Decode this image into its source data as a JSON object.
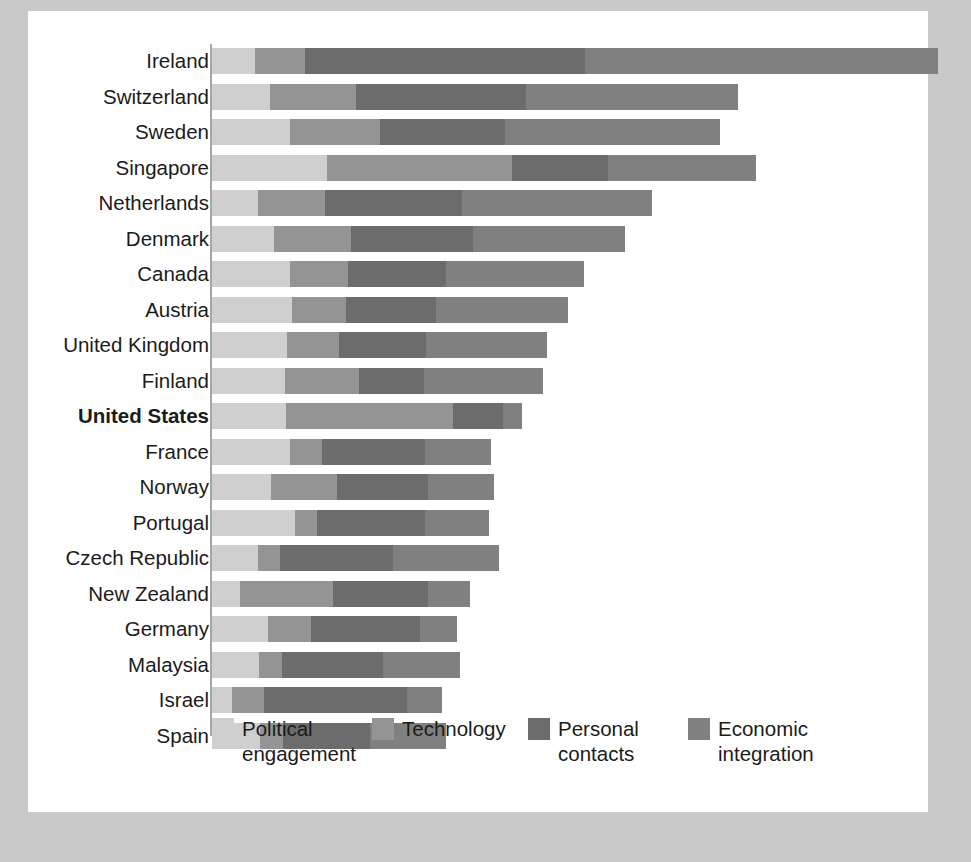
{
  "chart_data": {
    "type": "bar",
    "subtype": "horizontal-stacked",
    "title": "",
    "xlabel": "",
    "ylabel": "",
    "grid": false,
    "legend_position": "bottom",
    "axis_origin_px": 212,
    "px_per_unit": 7.26,
    "xlim": [
      0,
      100
    ],
    "categories": [
      "Ireland",
      "Switzerland",
      "Sweden",
      "Singapore",
      "Netherlands",
      "Denmark",
      "Canada",
      "Austria",
      "United Kingdom",
      "Finland",
      "United States",
      "France",
      "Norway",
      "Portugal",
      "Czech Republic",
      "New Zealand",
      "Germany",
      "Malaysia",
      "Israel",
      "Spain"
    ],
    "highlighted_category": "United States",
    "series": [
      {
        "name": "Political engagement",
        "color": "#cfcfcf",
        "values": [
          5.9,
          8.0,
          10.7,
          15.8,
          6.3,
          8.5,
          10.7,
          11.0,
          10.3,
          10.0,
          10.2,
          10.7,
          8.1,
          11.4,
          6.3,
          3.9,
          7.7,
          6.5,
          2.8,
          6.6
        ]
      },
      {
        "name": "Technology",
        "color": "#949494",
        "values": [
          6.9,
          11.8,
          12.4,
          25.5,
          9.2,
          10.6,
          8.1,
          7.4,
          7.2,
          10.3,
          23.0,
          4.4,
          9.1,
          3.0,
          3.0,
          12.8,
          6.0,
          3.2,
          4.3,
          3.2
        ]
      },
      {
        "name": "Personal contacts",
        "color": "#6c6c6c",
        "values": [
          38.6,
          23.4,
          17.2,
          13.2,
          18.9,
          16.8,
          13.5,
          12.4,
          12.0,
          8.9,
          6.9,
          14.3,
          12.6,
          14.9,
          15.6,
          13.1,
          14.9,
          13.8,
          19.8,
          11.9
        ]
      },
      {
        "name": "Economic integration",
        "color": "#808080",
        "values": [
          48.6,
          29.3,
          29.7,
          20.4,
          26.2,
          21.0,
          18.9,
          18.3,
          16.6,
          16.4,
          2.6,
          9.1,
          9.0,
          8.8,
          14.7,
          5.7,
          5.1,
          10.6,
          4.8,
          10.5
        ]
      }
    ],
    "totals": [
      100.0,
      72.5,
      70.0,
      74.9,
      60.6,
      56.9,
      51.2,
      49.1,
      46.1,
      45.6,
      42.7,
      38.5,
      38.8,
      38.1,
      39.6,
      35.5,
      33.7,
      34.1,
      31.7,
      32.2
    ]
  },
  "legend": {
    "items": [
      {
        "label": "Political\nengagement",
        "color": "#cfcfcf",
        "left": 184
      },
      {
        "label": "Technology",
        "color": "#949494",
        "left": 344
      },
      {
        "label": "Personal\ncontacts",
        "color": "#6c6c6c",
        "left": 500
      },
      {
        "label": "Economic\nintegration",
        "color": "#808080",
        "left": 660
      }
    ]
  },
  "colors": {
    "page_background": "#c9c9c9",
    "card_background": "#ffffff",
    "axis": "#a6a6a6",
    "text": "#1b1b1b"
  }
}
